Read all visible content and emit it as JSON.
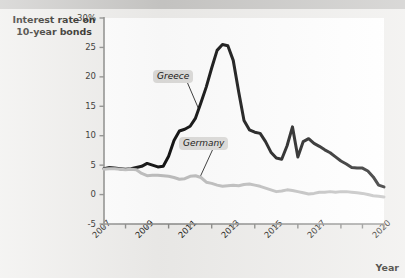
{
  "figure": {
    "background_color": "#efeeec",
    "plot_background_color": "#ffffff",
    "top_band_color": "#c9c8c6"
  },
  "axis_titles": {
    "y_line1": "Interest rate on",
    "y_line2": "10-year bonds",
    "x": "Year"
  },
  "labels": {
    "greece": "Greece",
    "germany": "Germany"
  },
  "chart_data": {
    "type": "line",
    "title": "",
    "subtitle": "",
    "xlabel": "Year",
    "ylabel": "Interest rate on 10-year bonds",
    "xlim": [
      2007,
      2020
    ],
    "ylim": [
      -5,
      30
    ],
    "grid": false,
    "legend_position": "inline-callout",
    "y_ticks": [
      -5,
      0,
      5,
      10,
      15,
      20,
      25,
      30
    ],
    "y_tick_labels": [
      "-5",
      "0",
      "5",
      "10",
      "15",
      "20",
      "25",
      "30%"
    ],
    "x_ticks": [
      2007,
      2008,
      2009,
      2010,
      2011,
      2012,
      2013,
      2014,
      2015,
      2016,
      2017,
      2018,
      2019,
      2020
    ],
    "x_tick_labels": [
      "2007",
      "",
      "2009",
      "",
      "2011",
      "",
      "2013",
      "",
      "2015",
      "",
      "2017",
      "",
      "",
      "2020"
    ],
    "annotations": [
      {
        "text": "Greece",
        "x": 2010.3,
        "y": 20.0,
        "points_to_x": 2011.4,
        "points_to_y": 14.5
      },
      {
        "text": "Germany",
        "x": 2011.5,
        "y": 8.6,
        "points_to_x": 2011.45,
        "points_to_y": 2.9
      }
    ],
    "series": [
      {
        "name": "Greece",
        "color": "#141414",
        "line_width": 3.0,
        "x": [
          2007.0,
          2007.25,
          2007.5,
          2007.75,
          2008.0,
          2008.25,
          2008.5,
          2008.75,
          2009.0,
          2009.25,
          2009.5,
          2009.75,
          2010.0,
          2010.25,
          2010.5,
          2010.75,
          2011.0,
          2011.25,
          2011.5,
          2011.75,
          2012.0,
          2012.25,
          2012.5,
          2012.75,
          2013.0,
          2013.25,
          2013.5,
          2013.75,
          2014.0,
          2014.25,
          2014.5,
          2014.75,
          2015.0,
          2015.25,
          2015.5,
          2015.75,
          2016.0,
          2016.25,
          2016.5,
          2016.75,
          2017.0,
          2017.25,
          2017.5,
          2017.75,
          2018.0,
          2018.25,
          2018.5,
          2018.75,
          2019.0,
          2019.25,
          2019.5,
          2019.75,
          2020.0
        ],
        "y": [
          4.4,
          4.6,
          4.5,
          4.4,
          4.3,
          4.4,
          4.6,
          4.8,
          5.3,
          5.0,
          4.7,
          4.8,
          6.5,
          9.2,
          10.8,
          11.1,
          11.6,
          13.0,
          15.6,
          18.3,
          21.5,
          24.5,
          25.5,
          25.3,
          22.8,
          17.5,
          12.6,
          11.0,
          10.6,
          10.4,
          9.0,
          7.2,
          6.2,
          6.0,
          8.3,
          11.5,
          6.4,
          9.0,
          9.5,
          8.7,
          8.2,
          7.6,
          7.1,
          6.4,
          5.7,
          5.2,
          4.6,
          4.5,
          4.5,
          4.0,
          3.0,
          1.6,
          1.3
        ]
      },
      {
        "name": "Germany",
        "color": "#bfbfbf",
        "line_width": 3.0,
        "x": [
          2007.0,
          2007.25,
          2007.5,
          2007.75,
          2008.0,
          2008.25,
          2008.5,
          2008.75,
          2009.0,
          2009.25,
          2009.5,
          2009.75,
          2010.0,
          2010.25,
          2010.5,
          2010.75,
          2011.0,
          2011.25,
          2011.5,
          2011.75,
          2012.0,
          2012.25,
          2012.5,
          2012.75,
          2013.0,
          2013.25,
          2013.5,
          2013.75,
          2014.0,
          2014.25,
          2014.5,
          2014.75,
          2015.0,
          2015.25,
          2015.5,
          2015.75,
          2016.0,
          2016.25,
          2016.5,
          2016.75,
          2017.0,
          2017.25,
          2017.5,
          2017.75,
          2018.0,
          2018.25,
          2018.5,
          2018.75,
          2019.0,
          2019.25,
          2019.5,
          2019.75,
          2020.0
        ],
        "y": [
          4.3,
          4.4,
          4.4,
          4.3,
          4.2,
          4.3,
          4.2,
          3.6,
          3.2,
          3.3,
          3.3,
          3.2,
          3.1,
          2.9,
          2.6,
          2.7,
          3.1,
          3.2,
          2.9,
          2.1,
          1.9,
          1.6,
          1.4,
          1.5,
          1.6,
          1.5,
          1.7,
          1.8,
          1.6,
          1.4,
          1.1,
          0.8,
          0.5,
          0.6,
          0.8,
          0.7,
          0.5,
          0.3,
          0.1,
          0.2,
          0.4,
          0.4,
          0.5,
          0.4,
          0.5,
          0.5,
          0.4,
          0.3,
          0.2,
          0.0,
          -0.2,
          -0.3,
          -0.4
        ]
      }
    ]
  }
}
